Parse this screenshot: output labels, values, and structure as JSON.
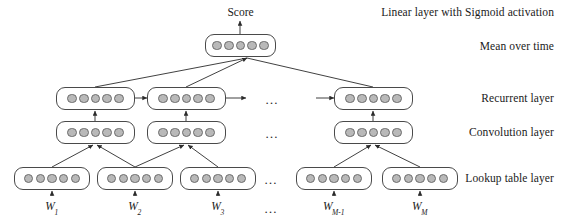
{
  "figure": {
    "title_text": "Score",
    "dots_per_box": 5,
    "ellipsis": "…"
  },
  "side_labels": [
    {
      "id": "linear-sigmoid",
      "text": "Linear layer with Sigmoid activation",
      "top": 6
    },
    {
      "id": "mean-over-time",
      "text": "Mean over time",
      "top": 40
    },
    {
      "id": "recurrent-layer",
      "text": "Recurrent layer",
      "top": 92
    },
    {
      "id": "convolution-layer",
      "text": "Convolution layer",
      "top": 126
    },
    {
      "id": "lookup-table-layer",
      "text": "Lookup table layer",
      "top": 172
    }
  ],
  "word_labels": [
    {
      "id": "w1",
      "base": "W",
      "sub": "1",
      "cx": 52,
      "top": 200
    },
    {
      "id": "w2",
      "base": "W",
      "sub": "2",
      "cx": 135,
      "top": 200
    },
    {
      "id": "w3",
      "base": "W",
      "sub": "3",
      "cx": 218,
      "top": 200
    },
    {
      "id": "wm1",
      "base": "W",
      "sub": "M-1",
      "cx": 334,
      "top": 200
    },
    {
      "id": "wm",
      "base": "W",
      "sub": "M",
      "cx": 420,
      "top": 200
    }
  ],
  "ellipses": [
    {
      "id": "ellipsis-recurrent",
      "x": 265,
      "y": 92
    },
    {
      "id": "ellipsis-convolution",
      "x": 265,
      "y": 126
    },
    {
      "id": "ellipsis-lookup",
      "x": 264,
      "y": 172
    },
    {
      "id": "ellipsis-words",
      "x": 264,
      "y": 201
    }
  ],
  "boxes": {
    "output": [
      {
        "id": "mean-over-time-box",
        "x": 205,
        "y": 34,
        "w": 71,
        "h": 23
      }
    ],
    "recurrent": [
      {
        "id": "recurrent-box-1",
        "x": 56,
        "y": 87,
        "w": 79,
        "h": 23
      },
      {
        "id": "recurrent-box-2",
        "x": 147,
        "y": 87,
        "w": 79,
        "h": 23
      },
      {
        "id": "recurrent-box-m",
        "x": 334,
        "y": 87,
        "w": 79,
        "h": 23
      }
    ],
    "convolution": [
      {
        "id": "convolution-box-1",
        "x": 56,
        "y": 121,
        "w": 79,
        "h": 23
      },
      {
        "id": "convolution-box-2",
        "x": 147,
        "y": 121,
        "w": 79,
        "h": 23
      },
      {
        "id": "convolution-box-m",
        "x": 334,
        "y": 121,
        "w": 79,
        "h": 23
      }
    ],
    "lookup": [
      {
        "id": "lookup-box-1",
        "x": 14,
        "y": 167,
        "w": 76,
        "h": 23
      },
      {
        "id": "lookup-box-2",
        "x": 97,
        "y": 167,
        "w": 76,
        "h": 23
      },
      {
        "id": "lookup-box-3",
        "x": 180,
        "y": 167,
        "w": 76,
        "h": 23
      },
      {
        "id": "lookup-box-m1",
        "x": 296,
        "y": 167,
        "w": 76,
        "h": 23
      },
      {
        "id": "lookup-box-m",
        "x": 382,
        "y": 167,
        "w": 76,
        "h": 23
      }
    ]
  },
  "colors": {
    "stroke": "#4a4a4a",
    "dot_fill": "#b9b9b9",
    "dot_stroke": "#6d6d6d",
    "text": "#1a1a1a",
    "background": "#ffffff"
  },
  "connections": {
    "score_arrow": {
      "x": 240,
      "y1": 34,
      "y2": 21
    },
    "mean_inputs": [
      {
        "from_x": 95,
        "from_y": 87,
        "to_x": 247,
        "to_y": 58
      },
      {
        "from_x": 186,
        "from_y": 87,
        "to_x": 247,
        "to_y": 58
      },
      {
        "from_x": 373,
        "from_y": 87,
        "to_x": 247,
        "to_y": 58
      }
    ],
    "recurrent_horizontal": [
      {
        "x1": 135,
        "x2": 147,
        "y": 98
      },
      {
        "x1": 226,
        "x2": 246,
        "y": 98
      },
      {
        "x1": 316,
        "x2": 334,
        "y": 98
      }
    ],
    "conv_to_recurrent": [
      {
        "x": 95,
        "y1": 121,
        "y2": 111
      },
      {
        "x": 186,
        "y1": 121,
        "y2": 111
      },
      {
        "x": 373,
        "y1": 121,
        "y2": 111
      }
    ],
    "lookup_to_conv": [
      {
        "from_x": 52,
        "to_x": 93,
        "from_y": 167,
        "to_y": 145
      },
      {
        "from_x": 135,
        "to_x": 97,
        "from_y": 167,
        "to_y": 145
      },
      {
        "from_x": 135,
        "to_x": 184,
        "from_y": 167,
        "to_y": 145
      },
      {
        "from_x": 218,
        "to_x": 188,
        "from_y": 167,
        "to_y": 145
      },
      {
        "from_x": 334,
        "to_x": 371,
        "from_y": 167,
        "to_y": 145
      },
      {
        "from_x": 420,
        "to_x": 375,
        "from_y": 167,
        "to_y": 145
      }
    ],
    "word_arrows": [
      {
        "x": 52,
        "y1": 196,
        "y2": 191
      },
      {
        "x": 135,
        "y1": 196,
        "y2": 191
      },
      {
        "x": 218,
        "y1": 196,
        "y2": 191
      },
      {
        "x": 334,
        "y1": 196,
        "y2": 191
      },
      {
        "x": 420,
        "y1": 196,
        "y2": 191
      }
    ]
  }
}
